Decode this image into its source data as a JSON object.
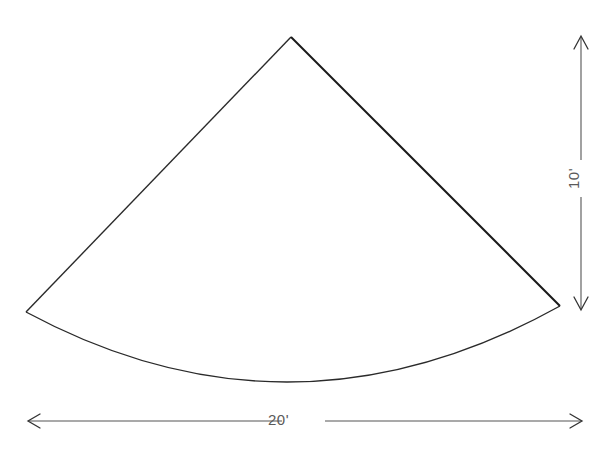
{
  "diagram": {
    "type": "sector-flat-pattern",
    "colors": {
      "background": "#ffffff",
      "outline": "#2a2a2a",
      "dimension": "#555555",
      "label": "#5a5a5a"
    },
    "shape": {
      "apex": [
        291,
        37
      ],
      "left_corner": [
        26,
        312
      ],
      "right_corner": [
        560,
        306
      ],
      "arc_low_point": [
        290,
        383
      ]
    },
    "dimensions": {
      "width": {
        "label": "20'",
        "orientation": "horizontal",
        "from": [
          28,
          421
        ],
        "to": [
          582,
          421
        ]
      },
      "height": {
        "label": "10'",
        "orientation": "vertical",
        "from": [
          580,
          36
        ],
        "to": [
          580,
          310
        ]
      }
    }
  }
}
